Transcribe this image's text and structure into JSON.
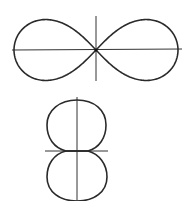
{
  "figures": [
    {
      "name": "lemniscate-horizontal",
      "description": "figure-eight curve with horizontal major axis",
      "curve_color": "#2a2a2a",
      "axis_color": "#333333"
    },
    {
      "name": "figure-eight-vertical",
      "description": "two tangent circular loops stacked vertically",
      "curve_color": "#2a2a2a",
      "axis_color": "#333333"
    }
  ]
}
